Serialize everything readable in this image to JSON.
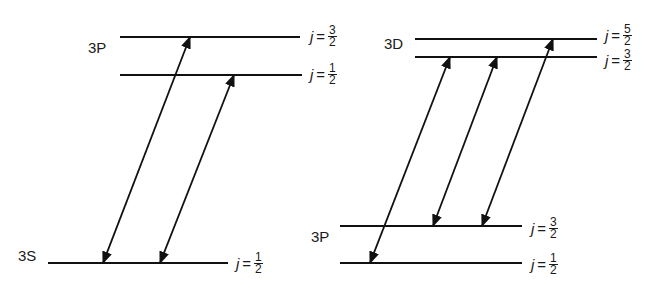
{
  "colors": {
    "line": "#111111",
    "background": "#ffffff"
  },
  "left_diagram": {
    "levels": [
      {
        "id": "3P-3/2",
        "term": "3P",
        "j_num": "3",
        "j_den": "2",
        "y": 37,
        "x1": 120,
        "x2": 300
      },
      {
        "id": "3P-1/2",
        "term": "",
        "j_num": "1",
        "j_den": "2",
        "y": 75,
        "x1": 120,
        "x2": 302
      },
      {
        "id": "3S-1/2",
        "term": "3S",
        "j_num": "1",
        "j_den": "2",
        "y": 263,
        "x1": 48,
        "x2": 228
      }
    ],
    "term_labels": [
      {
        "text": "3P",
        "x": 88,
        "y": 48
      },
      {
        "text": "3S",
        "x": 18,
        "y": 256
      }
    ],
    "transitions": [
      {
        "from": "3S-1/2",
        "to": "3P-3/2",
        "x1": 103,
        "y1": 263,
        "x2": 190,
        "y2": 37
      },
      {
        "from": "3S-1/2",
        "to": "3P-1/2",
        "x1": 160,
        "y1": 263,
        "x2": 234,
        "y2": 75
      }
    ],
    "j_labels": [
      {
        "j": "j",
        "eq": "=",
        "num": "3",
        "den": "2",
        "x": 310,
        "y": 37
      },
      {
        "j": "j",
        "eq": "=",
        "num": "1",
        "den": "2",
        "x": 310,
        "y": 75
      },
      {
        "j": "j",
        "eq": "=",
        "num": "1",
        "den": "2",
        "x": 236,
        "y": 264
      }
    ]
  },
  "right_diagram": {
    "levels": [
      {
        "id": "3D-5/2",
        "term": "3D",
        "y": 39,
        "x1": 415,
        "x2": 597
      },
      {
        "id": "3D-3/2",
        "term": "",
        "y": 57,
        "x1": 415,
        "x2": 597
      },
      {
        "id": "3P-3/2",
        "term": "3P",
        "y": 226,
        "x1": 340,
        "x2": 522
      },
      {
        "id": "3P-1/2",
        "term": "",
        "y": 263,
        "x1": 340,
        "x2": 522
      }
    ],
    "term_labels": [
      {
        "text": "3D",
        "x": 384,
        "y": 44
      },
      {
        "text": "3P",
        "x": 311,
        "y": 237
      }
    ],
    "transitions": [
      {
        "from": "3P-1/2",
        "to": "3D-3/2",
        "x1": 370,
        "y1": 263,
        "x2": 450,
        "y2": 57
      },
      {
        "from": "3P-3/2",
        "to": "3D-3/2",
        "x1": 433,
        "y1": 226,
        "x2": 497,
        "y2": 57
      },
      {
        "from": "3P-3/2",
        "to": "3D-5/2",
        "x1": 482,
        "y1": 226,
        "x2": 553,
        "y2": 39
      }
    ],
    "j_labels": [
      {
        "j": "j",
        "eq": "=",
        "num": "5",
        "den": "2",
        "x": 605,
        "y": 36
      },
      {
        "j": "j",
        "eq": "=",
        "num": "3",
        "den": "2",
        "x": 605,
        "y": 61
      },
      {
        "j": "j",
        "eq": "=",
        "num": "3",
        "den": "2",
        "x": 531,
        "y": 229
      },
      {
        "j": "j",
        "eq": "=",
        "num": "1",
        "den": "2",
        "x": 531,
        "y": 265
      }
    ]
  }
}
